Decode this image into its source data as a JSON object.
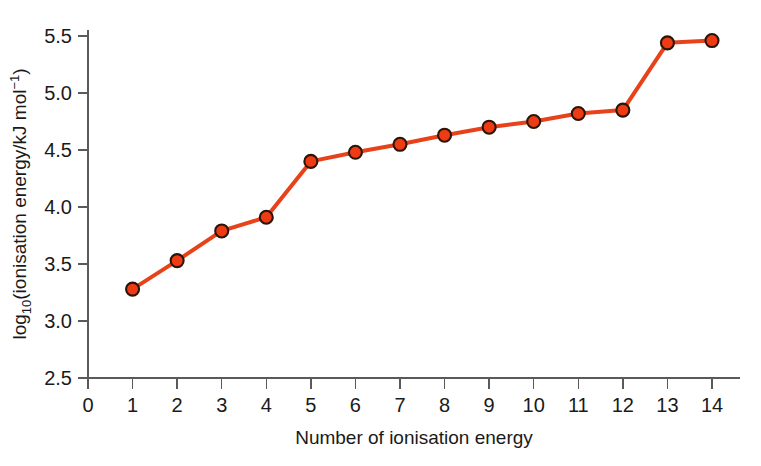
{
  "chart_data": {
    "type": "line",
    "title": "",
    "xlabel": "Number of ionisation energy",
    "ylabel": "log10(ionisation energy/kJ mol-1)",
    "ylabel_parts": {
      "prefix": "log",
      "subscript": "10",
      "middle": "(ionisation energy/kJ mol",
      "superscript": "−1",
      "suffix": ")"
    },
    "x": [
      1,
      2,
      3,
      4,
      5,
      6,
      7,
      8,
      9,
      10,
      11,
      12,
      13,
      14
    ],
    "values": [
      3.28,
      3.53,
      3.79,
      3.91,
      4.4,
      4.48,
      4.55,
      4.63,
      4.7,
      4.75,
      4.82,
      4.85,
      5.44,
      5.46
    ],
    "series": [
      {
        "name": "log10(ionisation energy)",
        "values": [
          3.28,
          3.53,
          3.79,
          3.91,
          4.4,
          4.48,
          4.55,
          4.63,
          4.7,
          4.75,
          4.82,
          4.85,
          5.44,
          5.46
        ]
      }
    ],
    "xlim": [
      0,
      14
    ],
    "ylim": [
      2.5,
      5.5
    ],
    "xticks": [
      0,
      1,
      2,
      3,
      4,
      5,
      6,
      7,
      8,
      9,
      10,
      11,
      12,
      13,
      14
    ],
    "xticklabels": [
      "0",
      "1",
      "2",
      "3",
      "4",
      "5",
      "6",
      "7",
      "8",
      "9",
      "10",
      "11",
      "12",
      "13",
      "14"
    ],
    "yticks": [
      2.5,
      3.0,
      3.5,
      4.0,
      4.5,
      5.0,
      5.5
    ],
    "yticklabels": [
      "2.5",
      "3.0",
      "3.5",
      "4.0",
      "4.5",
      "5.0",
      "5.5"
    ],
    "grid": false,
    "legend": "none",
    "colors": {
      "line": "#E8421A",
      "marker_fill": "#EE3B13",
      "marker_edge": "#2A1508",
      "axis": "#5A5A5A",
      "text": "#1A1A1A",
      "background": "#FFFFFF"
    },
    "style": {
      "line_width_px": 4,
      "marker_radius_px": 6.5
    }
  }
}
